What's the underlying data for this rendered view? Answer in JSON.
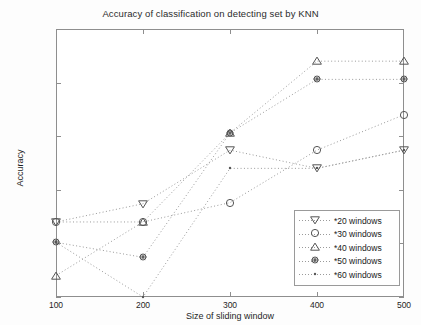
{
  "chart_data": {
    "type": "line",
    "title": "Accuracy of classification on detecting set by KNN",
    "xlabel": "Size of sliding window",
    "ylabel": "Accuracy",
    "x": [
      100,
      200,
      300,
      400,
      500
    ],
    "xticklabels": [
      "100",
      "200",
      "300",
      "400",
      "500"
    ],
    "yticklabels": [
      "0.95",
      "0.955",
      "0.96",
      "0.965",
      "0.97",
      "0.975"
    ],
    "yticks": [
      0.95,
      0.955,
      0.96,
      0.965,
      0.97,
      0.975
    ],
    "xlim": [
      100,
      500
    ],
    "ylim": [
      0.95,
      0.975
    ],
    "grid": false,
    "linestyle": "dotted",
    "legend_position": "lower right",
    "series": [
      {
        "name": "*20 windows",
        "marker": "triangle-down",
        "values": [
          0.957,
          0.9587,
          0.9637,
          0.962,
          0.9637
        ]
      },
      {
        "name": "*30 windows",
        "marker": "circle",
        "values": [
          0.957,
          0.957,
          0.9588,
          0.9637,
          0.967
        ]
      },
      {
        "name": "*40 windows",
        "marker": "triangle-up",
        "values": [
          0.952,
          0.957,
          0.9653,
          0.972,
          0.972
        ]
      },
      {
        "name": "*50 windows",
        "marker": "asterisk-circle",
        "values": [
          0.9551,
          0.9537,
          0.9653,
          0.9703,
          0.9703
        ]
      },
      {
        "name": "*60 windows",
        "marker": "dot",
        "values": [
          0.9551,
          0.95,
          0.962,
          0.962,
          0.9637
        ]
      }
    ]
  },
  "colors": {
    "axis": "#8e8e8e",
    "line": "#9a9a9a",
    "marker": "#555555",
    "text": "#1a1a1a",
    "background": "#ffffff"
  }
}
